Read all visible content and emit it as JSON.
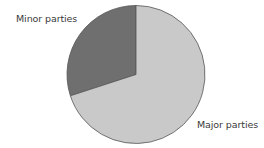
{
  "chart_data": {
    "type": "pie",
    "title": "",
    "categories": [
      "Minor parties",
      "Major parties"
    ],
    "values": [
      30,
      70
    ],
    "colors": [
      "#6f6f6f",
      "#c9c9c9"
    ],
    "start_angle_deg": 0,
    "direction": "counterclockwise-for-first-slice",
    "legend": "none (direct labels)",
    "labels": {
      "minor": "Minor parties",
      "major": "Major parties"
    }
  }
}
